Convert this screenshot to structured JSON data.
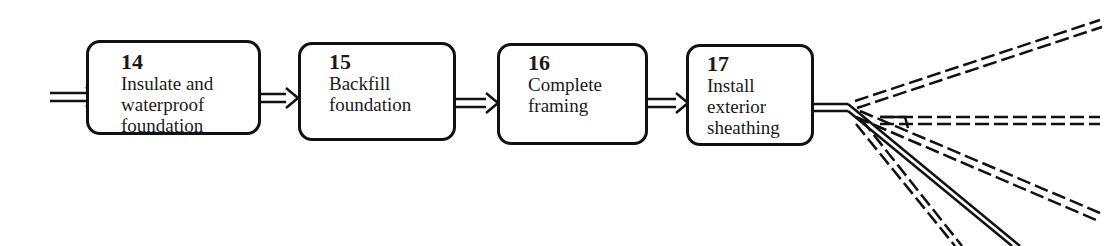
{
  "diagram": {
    "type": "flowchart",
    "steps": [
      {
        "number": "14",
        "label": "Insulate and\nwaterproof\nfoundation"
      },
      {
        "number": "15",
        "label": "Backfill\nfoundation"
      },
      {
        "number": "16",
        "label": "Complete\nframing"
      },
      {
        "number": "17",
        "label": "Install\nexterior\nsheathing"
      }
    ],
    "connectors": {
      "incoming": "solid double-line arrow into step 14",
      "outgoing_from_17": [
        "dashed branch up-right",
        "dashed branch right",
        "dashed branch down-right",
        "dashed branch steep down",
        "solid branch steep down"
      ]
    },
    "colors": {
      "stroke": "#111111",
      "background": "#ffffff",
      "text": "#1a1a1a"
    }
  }
}
